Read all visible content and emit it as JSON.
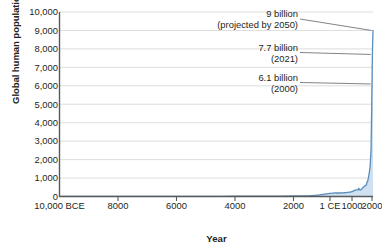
{
  "chart_data": {
    "type": "area",
    "title": "",
    "xlabel": "Year",
    "ylabel": "Global human population (billions)",
    "ylim": [
      0,
      10000
    ],
    "yticks": [
      "0",
      "1,000",
      "2,000",
      "3,000",
      "4,000",
      "5,000",
      "6,000",
      "7,000",
      "8,000",
      "9,000",
      "10,000"
    ],
    "ytick_values": [
      0,
      1000,
      2000,
      3000,
      4000,
      5000,
      6000,
      7000,
      8000,
      9000,
      10000
    ],
    "xticks": [
      "10,000 BCE",
      "8000",
      "6000",
      "4000",
      "2000",
      "1 CE",
      "1000",
      "2000"
    ],
    "xtick_values": [
      -10000,
      -8000,
      -6000,
      -4000,
      -2000,
      1,
      1000,
      2000
    ],
    "grid": true,
    "legend": "none",
    "line_color": "#5b8dbb",
    "fill_color": "#cfe0f0",
    "grid_color": "#d9d9d9",
    "axis_color": "#58595b",
    "series": [
      {
        "name": "Global human population",
        "x": [
          -10000,
          -9000,
          -8000,
          -7000,
          -6000,
          -5000,
          -4000,
          -3000,
          -2000,
          -1000,
          -500,
          1,
          200,
          400,
          600,
          800,
          1000,
          1100,
          1200,
          1300,
          1340,
          1400,
          1500,
          1600,
          1700,
          1750,
          1800,
          1850,
          1900,
          1927,
          1950,
          1960,
          1974,
          1987,
          1999,
          2000,
          2011,
          2021,
          2050
        ],
        "values": [
          4,
          5,
          5,
          7,
          7,
          10,
          14,
          20,
          27,
          50,
          100,
          170,
          190,
          190,
          200,
          220,
          265,
          320,
          360,
          360,
          443,
          350,
          425,
          545,
          610,
          770,
          900,
          1200,
          1600,
          2000,
          2500,
          3000,
          4000,
          5000,
          6000,
          6100,
          7000,
          7700,
          9000
        ]
      }
    ],
    "annotations": [
      {
        "id": "9b",
        "line1": "9 billion",
        "line2": "(projected by 2050)",
        "point_year": 2050,
        "point_value": 9000
      },
      {
        "id": "77b",
        "line1": "7.7 billion",
        "line2": "(2021)",
        "point_year": 2021,
        "point_value": 7700
      },
      {
        "id": "61b",
        "line1": "6.1 billion",
        "line2": "(2000)",
        "point_year": 2000,
        "point_value": 6100
      }
    ]
  }
}
